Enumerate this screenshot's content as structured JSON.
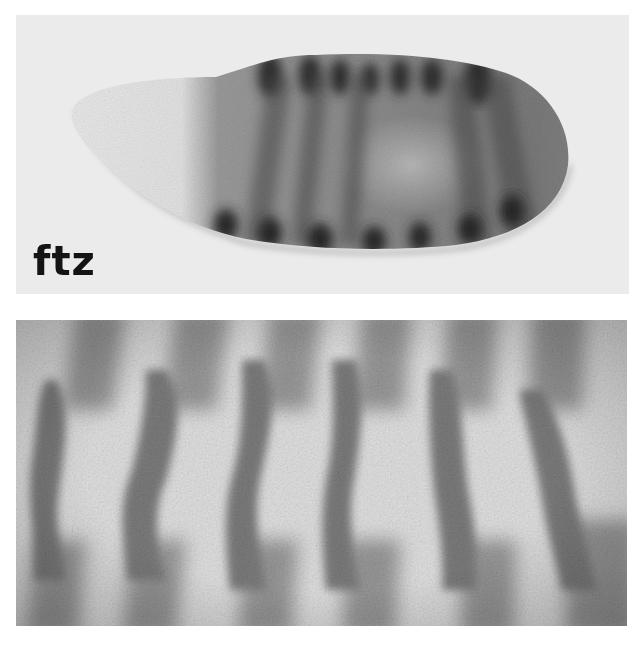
{
  "figure": {
    "panels": [
      {
        "id": "top",
        "description": "lateral view of whole embryo with stripe staining",
        "label": "ftz",
        "stripe_count_dorsal": 7,
        "stripe_count_ventral": 7
      },
      {
        "id": "bottom",
        "description": "close-up of stained stripes over cellular surface",
        "stripe_count": 7
      }
    ],
    "colors": {
      "background": "#ffffff",
      "top_panel_bg": "#ebebeb",
      "bottom_panel_bg": "#e2e2e2",
      "embryo_light": "#e4e4e4",
      "embryo_mid": "#8e8e8e",
      "stripe_dark": "#3a3a3a",
      "bottom_stripe": "#7a7a7a",
      "label": "#141414"
    }
  }
}
